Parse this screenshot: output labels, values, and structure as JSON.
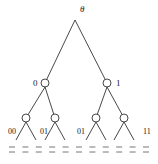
{
  "diagram": {
    "type": "binary-tree",
    "colors": {
      "line": "#333333",
      "text": "#222222",
      "dash": "#666666"
    },
    "root": {
      "label": "θ",
      "x": 75,
      "y": 20,
      "lx": 80,
      "ly": 12
    },
    "level1": [
      {
        "label": "0",
        "x": 45,
        "y": 83,
        "lx": 33,
        "ly": 86
      },
      {
        "label": "1",
        "x": 107,
        "y": 83,
        "lx": 116,
        "ly": 86
      }
    ],
    "level2": [
      {
        "x": 26,
        "y": 118
      },
      {
        "x": 55,
        "y": 118
      },
      {
        "x": 96,
        "y": 118
      },
      {
        "x": 124,
        "y": 118
      }
    ],
    "leaf_labels": [
      {
        "label": "00",
        "x": 8,
        "y": 134
      },
      {
        "label": "01",
        "x": 40,
        "y": 134
      },
      {
        "label": "01",
        "x": 77,
        "y": 134
      },
      {
        "label": "11",
        "x": 143,
        "y": 134
      }
    ],
    "dash_columns": 11
  }
}
